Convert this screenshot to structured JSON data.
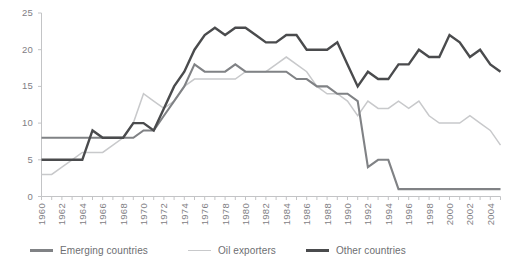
{
  "chart_top_partial_text": "",
  "axes": {
    "y_ticks": [
      "0",
      "5",
      "10",
      "15",
      "20",
      "25"
    ],
    "y_min": 0,
    "y_max": 25,
    "x_ticks": [
      "1960",
      "1962",
      "1964",
      "1966",
      "1968",
      "1970",
      "1972",
      "1974",
      "1976",
      "1978",
      "1980",
      "1982",
      "1984",
      "1986",
      "1988",
      "1990",
      "1992",
      "1994",
      "1996",
      "1998",
      "2000",
      "2002",
      "2004"
    ],
    "x_min": 1960,
    "x_max": 2005
  },
  "legend": {
    "items": [
      {
        "label": "Emerging countries",
        "color": "#808285"
      },
      {
        "label": "Oil exporters",
        "color": "#c8c9cb"
      },
      {
        "label": "Other countries",
        "color": "#4a4b4d"
      }
    ]
  },
  "chart_data": {
    "type": "line",
    "title": "",
    "subtitle": "",
    "xlabel": "",
    "ylabel": "",
    "xlim": [
      1960,
      2005
    ],
    "ylim": [
      0,
      25
    ],
    "grid": false,
    "legend_position": "bottom-left",
    "x": [
      1960,
      1961,
      1962,
      1963,
      1964,
      1965,
      1966,
      1967,
      1968,
      1969,
      1970,
      1971,
      1972,
      1973,
      1974,
      1975,
      1976,
      1977,
      1978,
      1979,
      1980,
      1981,
      1982,
      1983,
      1984,
      1985,
      1986,
      1987,
      1988,
      1989,
      1990,
      1991,
      1992,
      1993,
      1994,
      1995,
      1996,
      1997,
      1998,
      1999,
      2000,
      2001,
      2002,
      2003,
      2004,
      2005
    ],
    "series": [
      {
        "name": "Emerging countries",
        "color": "#808285",
        "width": 2.1,
        "values": [
          8,
          8,
          8,
          8,
          8,
          8,
          8,
          8,
          8,
          8,
          9,
          9,
          11,
          13,
          15,
          18,
          17,
          17,
          17,
          18,
          17,
          17,
          17,
          17,
          17,
          16,
          16,
          15,
          15,
          14,
          14,
          13,
          4,
          5,
          5,
          1,
          1,
          1,
          1,
          1,
          1,
          1,
          1,
          1,
          1,
          1
        ]
      },
      {
        "name": "Oil exporters",
        "color": "#c8c9cb",
        "width": 1.5,
        "values": [
          3,
          3,
          4,
          5,
          6,
          6,
          6,
          7,
          8,
          10,
          14,
          13,
          12,
          13,
          15,
          16,
          16,
          16,
          16,
          16,
          17,
          17,
          17,
          18,
          19,
          18,
          17,
          15,
          14,
          14,
          13,
          11,
          13,
          12,
          12,
          13,
          12,
          13,
          11,
          10,
          10,
          10,
          11,
          10,
          9,
          7
        ]
      },
      {
        "name": "Other countries",
        "color": "#4a4b4d",
        "width": 2.4,
        "values": [
          5,
          5,
          5,
          5,
          5,
          9,
          8,
          8,
          8,
          10,
          10,
          9,
          12,
          15,
          17,
          20,
          22,
          23,
          22,
          23,
          23,
          22,
          21,
          21,
          22,
          22,
          20,
          20,
          20,
          21,
          18,
          15,
          17,
          16,
          16,
          18,
          18,
          20,
          19,
          19,
          22,
          21,
          19,
          20,
          18,
          17
        ]
      }
    ]
  }
}
